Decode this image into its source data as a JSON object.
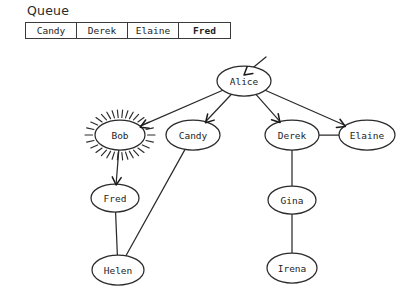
{
  "queue": {
    "title": "Queue",
    "items": [
      {
        "label": "Candy",
        "bold": false
      },
      {
        "label": "Derek",
        "bold": false
      },
      {
        "label": "Elaine",
        "bold": false
      },
      {
        "label": "Fred",
        "bold": true
      }
    ]
  },
  "graph": {
    "nodes": [
      {
        "id": "alice",
        "label": "Alice",
        "cx": 244,
        "cy": 81,
        "rx": 27,
        "ry": 15,
        "highlighted": false
      },
      {
        "id": "bob",
        "label": "Bob",
        "cx": 120,
        "cy": 135,
        "rx": 25,
        "ry": 15,
        "highlighted": true
      },
      {
        "id": "candy",
        "label": "Candy",
        "cx": 193,
        "cy": 135,
        "rx": 27,
        "ry": 15,
        "highlighted": false
      },
      {
        "id": "derek",
        "label": "Derek",
        "cx": 292,
        "cy": 135,
        "rx": 27,
        "ry": 15,
        "highlighted": false
      },
      {
        "id": "elaine",
        "label": "Elaine",
        "cx": 367,
        "cy": 135,
        "rx": 28,
        "ry": 15,
        "highlighted": false
      },
      {
        "id": "fred",
        "label": "Fred",
        "cx": 115,
        "cy": 198,
        "rx": 24,
        "ry": 14,
        "highlighted": false
      },
      {
        "id": "gina",
        "label": "Gina",
        "cx": 292,
        "cy": 200,
        "rx": 24,
        "ry": 14,
        "highlighted": false
      },
      {
        "id": "helen",
        "label": "Helen",
        "cx": 118,
        "cy": 270,
        "rx": 26,
        "ry": 15,
        "highlighted": false
      },
      {
        "id": "irena",
        "label": "Irena",
        "cx": 292,
        "cy": 268,
        "rx": 25,
        "ry": 15,
        "highlighted": false
      }
    ],
    "edges": [
      {
        "from": "alice",
        "to": "bob",
        "directed": true
      },
      {
        "from": "alice",
        "to": "candy",
        "directed": true
      },
      {
        "from": "alice",
        "to": "derek",
        "directed": true
      },
      {
        "from": "alice",
        "to": "elaine",
        "directed": true
      },
      {
        "from": "derek",
        "to": "elaine",
        "directed": false
      },
      {
        "from": "bob",
        "to": "fred",
        "directed": true
      },
      {
        "from": "fred",
        "to": "helen",
        "directed": false
      },
      {
        "from": "candy",
        "to": "helen",
        "directed": false
      },
      {
        "from": "derek",
        "to": "gina",
        "directed": false
      },
      {
        "from": "gina",
        "to": "irena",
        "directed": false
      }
    ],
    "root_arrow": {
      "node": "alice"
    },
    "colors": {
      "stroke": "#2b2b2b",
      "node_fill": "#ffffff",
      "label": "#1d1d1d",
      "background": "#ffffff"
    }
  }
}
